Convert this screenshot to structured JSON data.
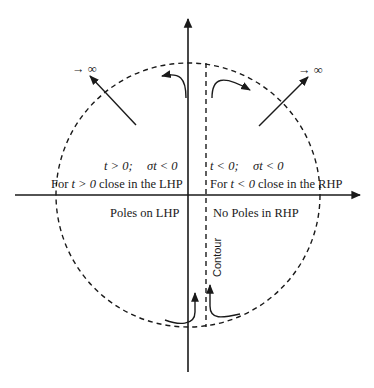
{
  "diagram": {
    "title": "",
    "labels": {
      "infinity_left": "→ ∞",
      "infinity_right": "→ ∞",
      "lhp_condition_t": "t > 0;",
      "lhp_condition_sigma": "σt < 0",
      "rhp_condition_t": "t < 0;",
      "rhp_condition_sigma": "σt < 0",
      "lhp_close_prefix": "For ",
      "lhp_close_var": "t > 0",
      "lhp_close_suffix": " close in the LHP",
      "rhp_close_prefix": "For ",
      "rhp_close_var": "t < 0",
      "rhp_close_suffix": " close in the RHP",
      "poles_lhp": "Poles on LHP",
      "poles_rhp": "No Poles in RHP",
      "contour": "Contour"
    },
    "colors": {
      "ink": "#1a1a1a",
      "background": "#ffffff"
    }
  }
}
